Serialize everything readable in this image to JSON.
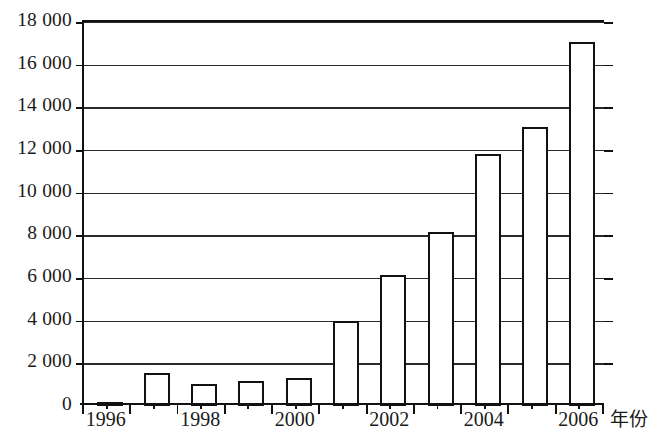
{
  "chart_data": {
    "type": "bar",
    "title": "",
    "subtitle": "",
    "xlabel": "年份",
    "ylabel": "",
    "categories": [
      "1996",
      "1997",
      "1998",
      "1999",
      "2000",
      "2001",
      "2002",
      "2003",
      "2004",
      "2005",
      "2006"
    ],
    "values": [
      120,
      1550,
      1030,
      1150,
      1300,
      4000,
      6150,
      8150,
      11800,
      13100,
      17050
    ],
    "ylim": [
      0,
      18000
    ],
    "ytick_labels": [
      "0",
      "2 000",
      "4 000",
      "6 000",
      "8 000",
      "10 000",
      "12 000",
      "14 000",
      "16 000",
      "18 000"
    ],
    "ytick_values": [
      0,
      2000,
      4000,
      6000,
      8000,
      10000,
      12000,
      14000,
      16000,
      18000
    ],
    "xtick_labels": [
      "1996",
      "1998",
      "2000",
      "2002",
      "2004",
      "2006"
    ],
    "grid": true,
    "legend": false,
    "bar_fill_color": "#ffffff",
    "bar_edge_color": "#111111",
    "axis_color": "#111111",
    "grid_color": "#2a2a2a",
    "background_color": "#ffffff"
  }
}
